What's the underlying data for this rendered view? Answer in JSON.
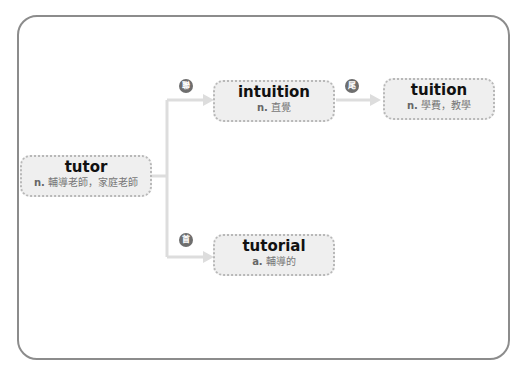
{
  "diagram": {
    "root": {
      "word": "tutor",
      "pos": "n.",
      "definition": "輔導老師，家庭老師"
    },
    "nodes": [
      {
        "word": "intuition",
        "pos": "n.",
        "definition": "直覺",
        "relation_badge": "聯"
      },
      {
        "word": "tuition",
        "pos": "n.",
        "definition": "學費，教學",
        "relation_badge": "尾"
      },
      {
        "word": "tutorial",
        "pos": "a.",
        "definition": "輔導的",
        "relation_badge": "首"
      }
    ],
    "colors": {
      "frame": "#8c8c8c",
      "node_bg": "#efefef",
      "connector": "#dcdcdc",
      "badge": "#6e6e6e"
    }
  }
}
